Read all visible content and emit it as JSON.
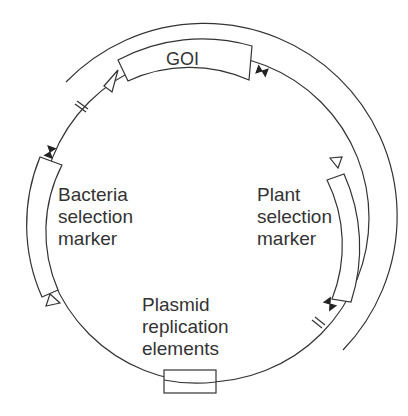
{
  "diagram": {
    "type": "plasmid-map",
    "elements": {
      "goi": "GOI",
      "bacteria_marker": [
        "Bacteria",
        "selection",
        "marker"
      ],
      "plant_marker": [
        "Plant",
        "selection",
        "marker"
      ],
      "replication": [
        "Plasmid",
        "replication",
        "elements"
      ]
    },
    "colors": {
      "stroke": "#333333",
      "background": "#ffffff"
    }
  }
}
